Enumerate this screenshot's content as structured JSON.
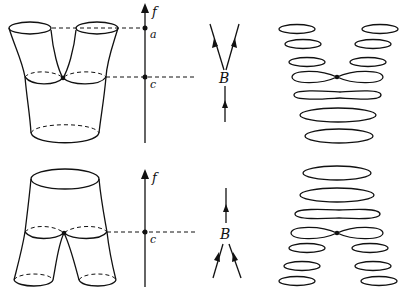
{
  "diagram": {
    "top_row": {
      "surface": "pair of pants (two tubes merging into one), critical point at saddle",
      "axis": {
        "label": "f",
        "ticks": [
          {
            "label": "a"
          },
          {
            "label": "c"
          }
        ]
      },
      "graph": {
        "node_label": "B",
        "description": "one edge in from below splits into two edges going up"
      },
      "level_sets": "two circles above, figure-eight at critical level, one circle below"
    },
    "bottom_row": {
      "surface": "inverted pair of pants (one tube splitting into two legs), critical point at saddle",
      "axis": {
        "label": "f",
        "ticks": [
          {
            "label": "c"
          }
        ]
      },
      "graph": {
        "node_label": "B",
        "description": "two edges merge from below into one edge going up"
      },
      "level_sets": "one circle above, figure-eight at critical level, two circles below"
    },
    "colors": {
      "ink": "#111111",
      "background": "#ffffff"
    }
  },
  "caption": ""
}
